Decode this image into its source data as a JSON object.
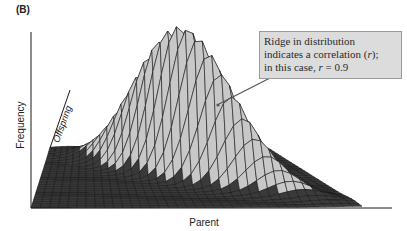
{
  "figure": {
    "panel_label": "(B)",
    "axes": {
      "vertical_label": "Frequency",
      "depth_label": "Offspring",
      "horizontal_label": "Parent"
    },
    "callout": {
      "line1": "Ridge in distribution",
      "line2_prefix": "indicates a correlation (",
      "line2_var": "r",
      "line2_suffix": ");",
      "line3_prefix": "in this case, ",
      "line3_var": "r",
      "line3_suffix": " = 0.9"
    },
    "colors": {
      "mesh_line": "#1a1a1a",
      "surface_fill": "#c8c8c8",
      "floor_fill": "#3a3a3a",
      "callout_bg": "#dcdcdc",
      "callout_border": "#9a9a9a",
      "arrow": "#555555"
    }
  },
  "chart_data": {
    "type": "surface",
    "title": "",
    "xlabel": "Parent",
    "ylabel": "Offspring",
    "zlabel": "Frequency",
    "correlation_r": 0.9,
    "annotation": "Ridge in distribution indicates a correlation (r); in this case, r = 0.9",
    "grid_resolution": [
      36,
      28
    ]
  }
}
